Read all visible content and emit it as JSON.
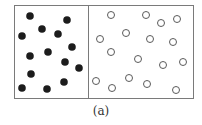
{
  "figure": {
    "caption": "(a)",
    "box": {
      "x": 14,
      "y": 5,
      "width": 179,
      "height": 93,
      "divider_x": 88
    },
    "colors": {
      "border": "#7a7a7a",
      "filled": "#1c1c1c",
      "open_stroke": "#5a5a5a",
      "background": "#ffffff"
    },
    "left_panel": {
      "label": "filled particles",
      "radius": 3.8,
      "particles": [
        [
          30,
          16
        ],
        [
          67,
          20
        ],
        [
          42,
          29
        ],
        [
          22,
          36
        ],
        [
          58,
          34
        ],
        [
          72,
          47
        ],
        [
          30,
          56
        ],
        [
          48,
          52
        ],
        [
          65,
          62
        ],
        [
          79,
          68
        ],
        [
          31,
          74
        ],
        [
          64,
          82
        ],
        [
          22,
          88
        ],
        [
          47,
          89
        ]
      ]
    },
    "right_panel": {
      "label": "open particles",
      "radius": 3.5,
      "particles": [
        [
          111,
          15
        ],
        [
          146,
          15
        ],
        [
          161,
          23
        ],
        [
          177,
          19
        ],
        [
          100,
          39
        ],
        [
          126,
          33
        ],
        [
          150,
          39
        ],
        [
          173,
          42
        ],
        [
          111,
          52
        ],
        [
          138,
          59
        ],
        [
          163,
          65
        ],
        [
          183,
          62
        ],
        [
          96,
          81
        ],
        [
          112,
          88
        ],
        [
          129,
          78
        ],
        [
          147,
          84
        ],
        [
          176,
          90
        ]
      ]
    }
  }
}
